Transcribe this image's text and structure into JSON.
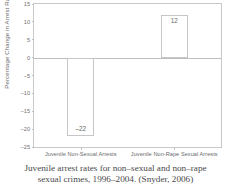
{
  "chart_data": {
    "type": "bar",
    "title": "",
    "xlabel": "",
    "ylabel": "Percentage Change in Arrest Rates",
    "categories": [
      "Juvenile Non-Sexual Arrests",
      "Juvenile Non-Rape Sexual Arrests"
    ],
    "values": [
      -22,
      12
    ],
    "value_labels": [
      "–22",
      "12"
    ],
    "ylim": [
      -25,
      15
    ],
    "yticks": [
      15,
      10,
      5,
      0,
      -5,
      -10,
      -15,
      -20,
      -25
    ],
    "ytick_labels": [
      "15",
      "10",
      "5",
      "0",
      "–5",
      "–10",
      "–15",
      "–20",
      "–25"
    ],
    "grid": false,
    "legend": "none",
    "bar_fill_color": "#ffffff",
    "bar_edge_color": "#c6c6c8",
    "axis_color": "#c9c9cb",
    "text_color": "#6a6a6c"
  },
  "caption": {
    "line1": "Juvenile arrest rates for non–sexual and non–rape",
    "line2": "sexual crimes, 1996–2004. (Snyder, 2006)"
  }
}
